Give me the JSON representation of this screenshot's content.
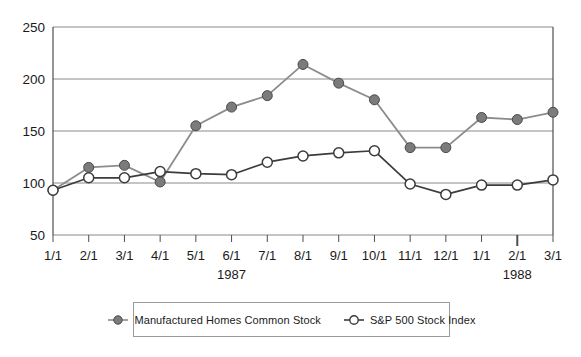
{
  "chart_data": {
    "type": "line",
    "title": "",
    "subtitle": "",
    "xlabel": "",
    "ylabel": "",
    "ylim": [
      50,
      250
    ],
    "yticks": [
      50,
      100,
      150,
      200,
      250
    ],
    "grid": true,
    "legend_position": "bottom",
    "categories": [
      "1/1",
      "2/1",
      "3/1",
      "4/1",
      "5/1",
      "6/1",
      "7/1",
      "8/1",
      "9/1",
      "10/1",
      "11/1",
      "12/1",
      "1/1",
      "2/1",
      "3/1"
    ],
    "group_labels": [
      {
        "label": "1987",
        "at_category_index": 5
      },
      {
        "label": "1988",
        "at_category_index": 13
      }
    ],
    "series": [
      {
        "name": "Manufactured Homes Common Stock",
        "marker": "filled-circle",
        "color": "#7b7b7b",
        "line_color": "#8c8c8c",
        "values": [
          93,
          115,
          117,
          101,
          155,
          173,
          184,
          214,
          196,
          180,
          134,
          134,
          163,
          161,
          168
        ]
      },
      {
        "name": "S&P 500 Stock Index",
        "marker": "open-circle",
        "color": "#ffffff",
        "line_color": "#3c3c3c",
        "values": [
          93,
          105,
          105,
          111,
          109,
          108,
          120,
          126,
          129,
          131,
          99,
          89,
          98,
          98,
          103
        ]
      }
    ]
  },
  "legend": {
    "entries": [
      {
        "label": "Manufactured Homes Common Stock",
        "marker": "filled-circle"
      },
      {
        "label": "S&P 500 Stock Index",
        "marker": "open-circle"
      }
    ]
  },
  "colors": {
    "series_1_fill": "#7b7b7b",
    "series_1_line": "#8c8c8c",
    "series_2_fill": "#ffffff",
    "series_2_line": "#3c3c3c",
    "axis": "#4d4d4d",
    "grid": "#8a8a8a",
    "text": "#1a1a1a",
    "background": "#ffffff"
  }
}
